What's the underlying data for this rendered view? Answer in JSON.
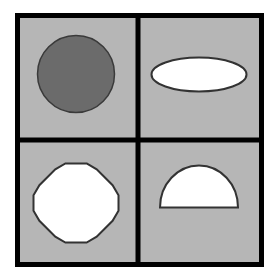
{
  "diagram": {
    "colors": {
      "background": "#ffffff",
      "cell_fill": "#b6b6b6",
      "grid_line": "#000000",
      "shape_stroke": "#333333",
      "dark_fill": "#6b6b6b",
      "light_fill": "#ffffff"
    },
    "cells": [
      {
        "position": "top-left",
        "shape": "circle",
        "fill": "dark"
      },
      {
        "position": "top-right",
        "shape": "ellipse",
        "fill": "light"
      },
      {
        "position": "bottom-left",
        "shape": "dodecagon",
        "fill": "light"
      },
      {
        "position": "bottom-right",
        "shape": "semicircle",
        "fill": "light"
      }
    ]
  }
}
